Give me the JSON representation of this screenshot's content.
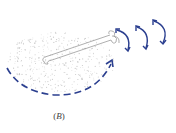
{
  "figure": {
    "panel_label_open": "(",
    "panel_label_letter": "B",
    "panel_label_close": ")",
    "elements": [
      {
        "name": "stippled-region",
        "description": "speckled oval area"
      },
      {
        "name": "tube",
        "description": "thin outlined tube extending to the right"
      },
      {
        "name": "tube-tip",
        "description": "small curled tip at tube end"
      },
      {
        "name": "dashed-arc-arrow",
        "description": "dashed curved arrow sweeping under the region, pointing up-right"
      },
      {
        "name": "rotation-arrows",
        "count": 3,
        "description": "curved double-headed arrows to the right of the tube tip"
      }
    ],
    "colors": {
      "arrow": "#2b3f8f",
      "stipple": "#c8c8c8",
      "tube": "#9a9a9a",
      "label": "#444444"
    }
  }
}
